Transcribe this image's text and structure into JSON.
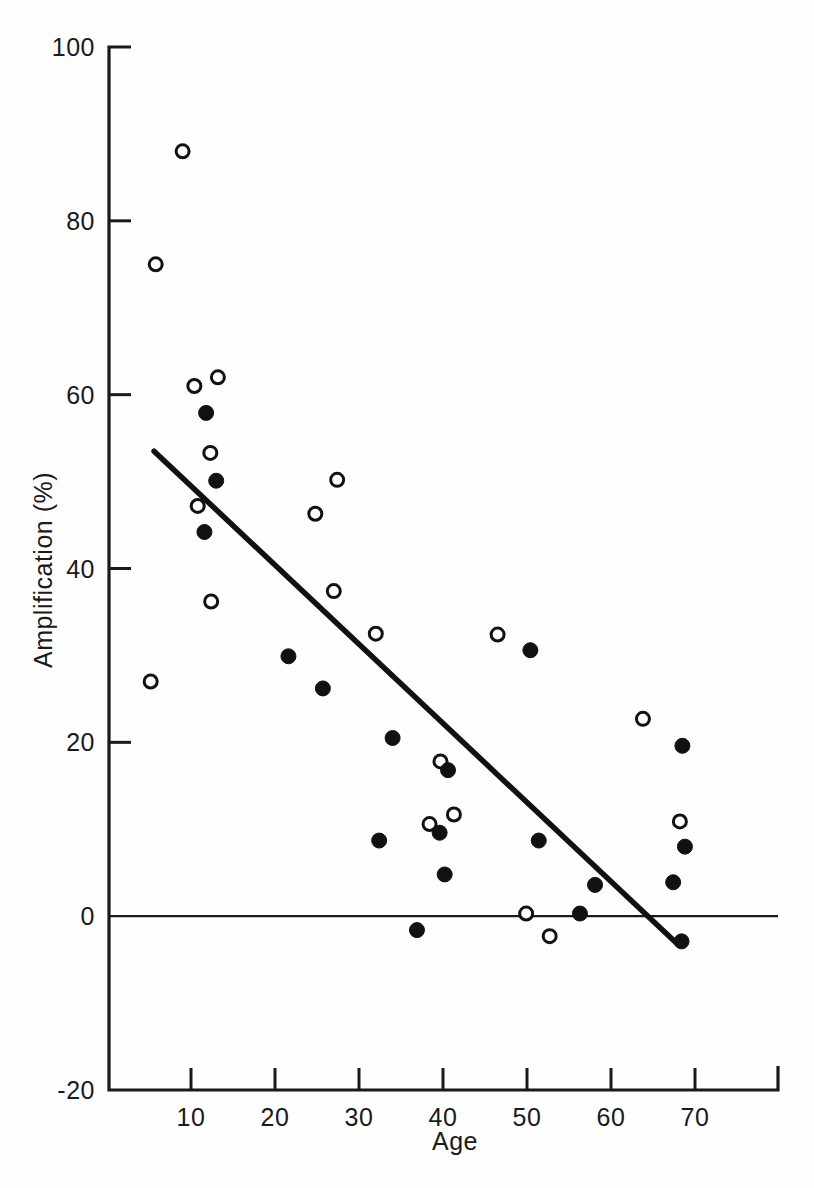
{
  "figure": {
    "background": "#ffffff",
    "ink_color": "#111111"
  },
  "chart_data": {
    "type": "scatter",
    "title": "",
    "xlabel": "Age",
    "ylabel": "Amplification (%)",
    "xlim": [
      3,
      73
    ],
    "ylim": [
      -20,
      100
    ],
    "xticks": [
      10,
      20,
      30,
      40,
      50,
      60,
      70
    ],
    "xtick_labels": [
      "10",
      "20",
      "30",
      "40",
      "50",
      "60",
      "70"
    ],
    "yticks": [
      -20,
      0,
      20,
      40,
      60,
      80,
      100
    ],
    "ytick_labels": [
      "-20",
      "0",
      "20",
      "40",
      "60",
      "80",
      "100"
    ],
    "grid": false,
    "legend_position": "none",
    "annotations": [
      {
        "name": "zero-reference-line",
        "kind": "horizontal-line",
        "y": 0,
        "x_start": 3,
        "x_end": 73
      },
      {
        "name": "regression-line",
        "kind": "trend-line",
        "x_start": 5.6,
        "y_start": 53.5,
        "x_end": 68.0,
        "y_end": -3.3
      }
    ],
    "series": [
      {
        "name": "open-circles",
        "marker": "open-circle",
        "marker_fill": "#ffffff",
        "marker_edge": "#111111",
        "points": [
          {
            "x": 9.0,
            "y": 88.0
          },
          {
            "x": 5.8,
            "y": 75.0
          },
          {
            "x": 10.4,
            "y": 61.0
          },
          {
            "x": 13.2,
            "y": 62.0
          },
          {
            "x": 12.3,
            "y": 53.3
          },
          {
            "x": 27.4,
            "y": 50.2
          },
          {
            "x": 10.8,
            "y": 47.2
          },
          {
            "x": 24.8,
            "y": 46.3
          },
          {
            "x": 27.0,
            "y": 37.4
          },
          {
            "x": 12.4,
            "y": 36.2
          },
          {
            "x": 32.0,
            "y": 32.5
          },
          {
            "x": 46.5,
            "y": 32.4
          },
          {
            "x": 5.2,
            "y": 27.0
          },
          {
            "x": 63.8,
            "y": 22.7
          },
          {
            "x": 39.7,
            "y": 17.8
          },
          {
            "x": 41.3,
            "y": 11.7
          },
          {
            "x": 38.4,
            "y": 10.6
          },
          {
            "x": 68.2,
            "y": 10.9
          },
          {
            "x": 49.9,
            "y": 0.3
          },
          {
            "x": 52.7,
            "y": -2.3
          }
        ]
      },
      {
        "name": "closed-circles",
        "marker": "filled-circle",
        "marker_fill": "#111111",
        "marker_edge": "#111111",
        "points": [
          {
            "x": 11.8,
            "y": 57.9
          },
          {
            "x": 13.0,
            "y": 50.1
          },
          {
            "x": 11.6,
            "y": 44.2
          },
          {
            "x": 21.6,
            "y": 29.9
          },
          {
            "x": 50.4,
            "y": 30.6
          },
          {
            "x": 25.7,
            "y": 26.2
          },
          {
            "x": 34.0,
            "y": 20.5
          },
          {
            "x": 68.5,
            "y": 19.6
          },
          {
            "x": 40.6,
            "y": 16.8
          },
          {
            "x": 39.6,
            "y": 9.6
          },
          {
            "x": 32.4,
            "y": 8.7
          },
          {
            "x": 51.4,
            "y": 8.7
          },
          {
            "x": 68.8,
            "y": 8.0
          },
          {
            "x": 40.2,
            "y": 4.8
          },
          {
            "x": 58.1,
            "y": 3.6
          },
          {
            "x": 67.4,
            "y": 3.9
          },
          {
            "x": 56.3,
            "y": 0.3
          },
          {
            "x": 36.9,
            "y": -1.6
          },
          {
            "x": 68.4,
            "y": -2.9
          }
        ]
      }
    ]
  }
}
